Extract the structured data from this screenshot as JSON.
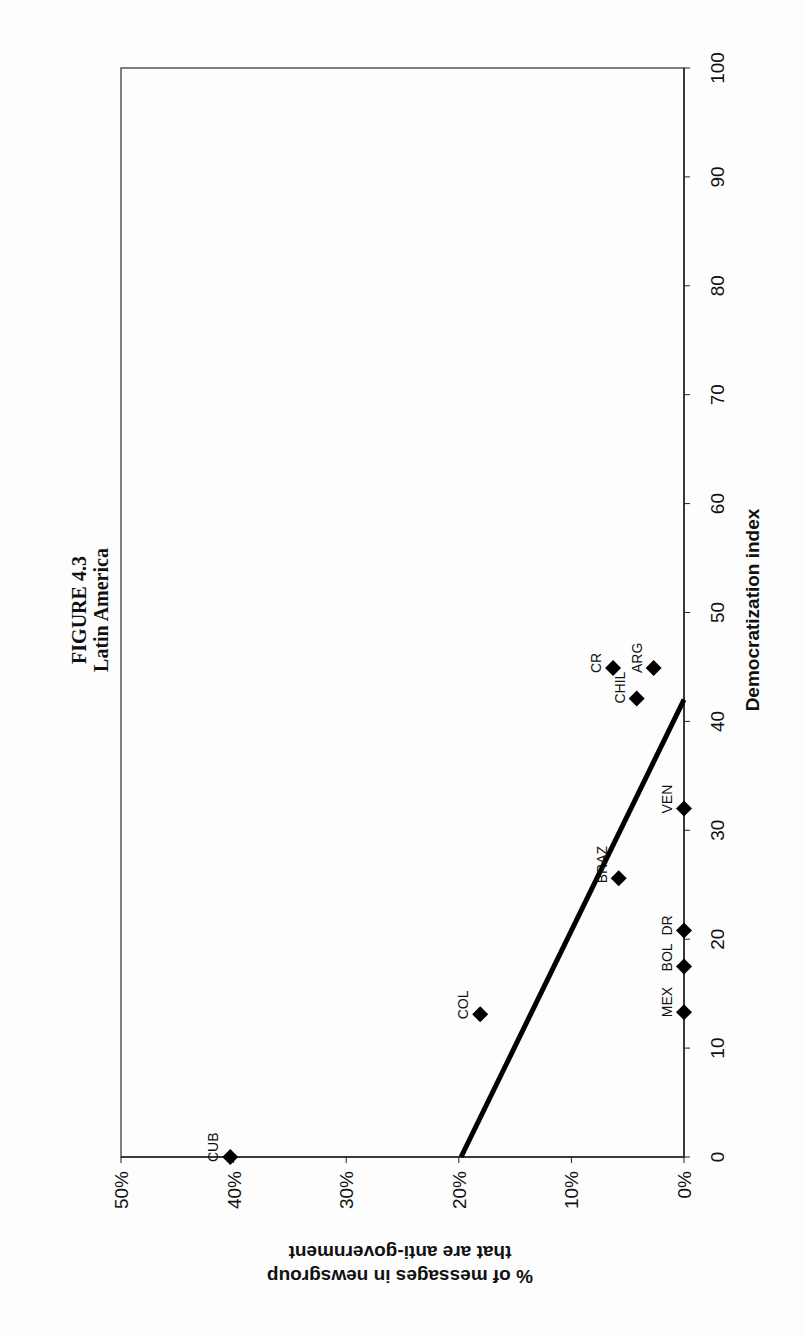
{
  "chart_data": {
    "type": "scatter",
    "title": "FIGURE 4.3",
    "subtitle": "Latin America",
    "xlabel": "Democratization index",
    "ylabel": "% of messages in newsgroup that are anti-government",
    "ylabel_lines": [
      "% of messages in newsgroup",
      "that are anti-government"
    ],
    "xlim": [
      0,
      100
    ],
    "ylim": [
      0,
      50
    ],
    "x_ticks": [
      0,
      10,
      20,
      30,
      40,
      50,
      60,
      70,
      80,
      90,
      100
    ],
    "y_ticks": [
      "0%",
      "10%",
      "20%",
      "30%",
      "40%",
      "50%"
    ],
    "y_tick_values": [
      0,
      10,
      20,
      30,
      40,
      50
    ],
    "grid": false,
    "legend": null,
    "orientation": "page rotated 90 degrees counter-clockwise",
    "points": [
      {
        "label": "CUB",
        "x": 0,
        "y": 40.3
      },
      {
        "label": "MEX",
        "x": 13.3,
        "y": 0
      },
      {
        "label": "COL",
        "x": 13.1,
        "y": 18.1
      },
      {
        "label": "BOL",
        "x": 17.5,
        "y": 0
      },
      {
        "label": "DR",
        "x": 20.8,
        "y": 0
      },
      {
        "label": "BRAZ",
        "x": 25.6,
        "y": 5.8
      },
      {
        "label": "VEN",
        "x": 32.0,
        "y": 0
      },
      {
        "label": "CHIL",
        "x": 42.1,
        "y": 4.2
      },
      {
        "label": "CR",
        "x": 44.9,
        "y": 6.3
      },
      {
        "label": "ARG",
        "x": 44.9,
        "y": 2.7
      }
    ],
    "trendline": {
      "x": [
        0,
        42.0
      ],
      "y": [
        19.8,
        0
      ]
    }
  }
}
